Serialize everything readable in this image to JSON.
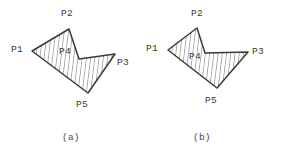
{
  "figure": {
    "background_color": "#ffffff",
    "stroke_color": "#3a3a3a",
    "hatch_color": "#555555",
    "label_color": "#3a3a3a",
    "panels": [
      {
        "id": "a",
        "caption": "(a)",
        "caption_pos": {
          "x": 62,
          "y": 133
        },
        "polygon_points": "32,51 69,29 79,59 115,54 88,93",
        "vertices": [
          {
            "name": "P1",
            "label": "P1",
            "point": {
              "x": 32,
              "y": 51
            },
            "label_pos": {
              "x": 11,
              "y": 45
            }
          },
          {
            "name": "P2",
            "label": "P2",
            "point": {
              "x": 69,
              "y": 29
            },
            "label_pos": {
              "x": 61,
              "y": 9
            }
          },
          {
            "name": "P3",
            "label": "P3",
            "point": {
              "x": 115,
              "y": 54
            },
            "label_pos": {
              "x": 117,
              "y": 58
            }
          },
          {
            "name": "P4",
            "label": "P4",
            "point": {
              "x": 79,
              "y": 59
            },
            "label_pos": {
              "x": 59,
              "y": 47
            }
          },
          {
            "name": "P5",
            "label": "P5",
            "point": {
              "x": 88,
              "y": 93
            },
            "label_pos": {
              "x": 76,
              "y": 100
            }
          }
        ]
      },
      {
        "id": "b",
        "caption": "(b)",
        "caption_pos": {
          "x": 193,
          "y": 133
        },
        "polygon_points": "168,50 197,28 205,53 248,52 217,88",
        "vertices": [
          {
            "name": "P1",
            "label": "P1",
            "point": {
              "x": 168,
              "y": 50
            },
            "label_pos": {
              "x": 146,
              "y": 44
            }
          },
          {
            "name": "P2",
            "label": "P2",
            "point": {
              "x": 197,
              "y": 28
            },
            "label_pos": {
              "x": 191,
              "y": 9
            }
          },
          {
            "name": "P3",
            "label": "P3",
            "point": {
              "x": 248,
              "y": 52
            },
            "label_pos": {
              "x": 252,
              "y": 47
            }
          },
          {
            "name": "P4",
            "label": "P4",
            "point": {
              "x": 205,
              "y": 53
            },
            "label_pos": {
              "x": 189,
              "y": 52
            }
          },
          {
            "name": "P5",
            "label": "P5",
            "point": {
              "x": 217,
              "y": 88
            },
            "label_pos": {
              "x": 205,
              "y": 96
            }
          }
        ]
      }
    ]
  }
}
